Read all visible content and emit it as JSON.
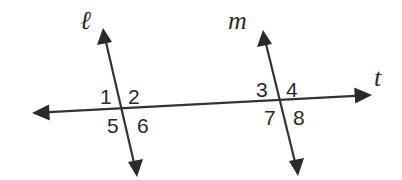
{
  "diagram": {
    "colors": {
      "stroke": "#333333",
      "text": "#2a2a2a",
      "background": "#ffffff"
    },
    "lines": {
      "t": {
        "label": "t",
        "role": "transversal"
      },
      "l": {
        "label": "ℓ",
        "role": "line"
      },
      "m": {
        "label": "m",
        "role": "line"
      }
    },
    "intersection_l": {
      "angles": [
        {
          "id": 1,
          "label": "1",
          "position": "upper-left"
        },
        {
          "id": 2,
          "label": "2",
          "position": "upper-right"
        },
        {
          "id": 5,
          "label": "5",
          "position": "lower-left"
        },
        {
          "id": 6,
          "label": "6",
          "position": "lower-right"
        }
      ]
    },
    "intersection_m": {
      "angles": [
        {
          "id": 3,
          "label": "3",
          "position": "upper-left"
        },
        {
          "id": 4,
          "label": "4",
          "position": "upper-right"
        },
        {
          "id": 7,
          "label": "7",
          "position": "lower-left"
        },
        {
          "id": 8,
          "label": "8",
          "position": "lower-right"
        }
      ]
    }
  }
}
